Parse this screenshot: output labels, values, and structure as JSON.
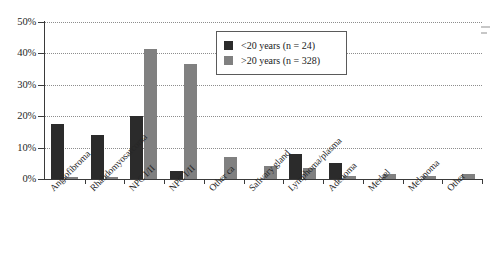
{
  "chart_data": {
    "type": "bar",
    "title": "",
    "xlabel": "",
    "ylabel": "",
    "ylim": [
      0,
      50
    ],
    "ytick_labels": [
      "0%",
      "10%",
      "20%",
      "30%",
      "40%",
      "50%"
    ],
    "ytick_values": [
      0,
      10,
      20,
      30,
      40,
      50
    ],
    "grid": true,
    "legend_position": "top-center-right",
    "categories": [
      "Angiofibroma",
      "Rhabdomyosarcoma",
      "NPC I/II",
      "NPC I/II",
      "Other ca",
      "Salivary gland",
      "Lymphoma/plasma",
      "Adenoma",
      "Merkel",
      "Melanoma",
      "Other"
    ],
    "series": [
      {
        "name": "<20 years (n = 24)",
        "color": "#2b2b2b",
        "values": [
          17.5,
          14.0,
          20.0,
          2.5,
          0,
          0,
          8.0,
          5.0,
          0,
          0,
          0
        ]
      },
      {
        "name": ">20 years (n = 328)",
        "color": "#808080",
        "values": [
          0.6,
          0.5,
          41.5,
          36.5,
          7.0,
          4.0,
          3.5,
          1.0,
          1.5,
          1.0,
          1.5
        ]
      }
    ]
  },
  "legend": {
    "items": [
      {
        "label": "<20 years (n = 24)",
        "color": "#2b2b2b",
        "swatch_name": "legend-swatch-young"
      },
      {
        "label": ">20 years (n = 328)",
        "color": "#808080",
        "swatch_name": "legend-swatch-old"
      }
    ]
  }
}
